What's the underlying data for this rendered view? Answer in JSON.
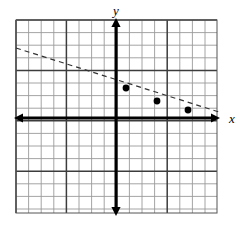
{
  "figure": {
    "kind": "cartesian-coordinate-grid",
    "title": "",
    "background_color": "#ffffff"
  },
  "grid": {
    "left_px": 16,
    "top_px": 20,
    "right_px": 217,
    "bottom_px": 213,
    "cell_px": 12.6,
    "columns": 16,
    "rows": 15,
    "minor_color": "#9a9a9a",
    "major_color": "#3c3c3c",
    "major_every": 4,
    "minor_width": 0.9,
    "major_width": 1.5,
    "border_color": "#555555"
  },
  "axes": {
    "origin_x_px": 116,
    "origin_y_px": 118,
    "color": "#000000",
    "stroke_width": 3,
    "arrow_size": 7,
    "x_axis": {
      "label": "x",
      "label_x_px": 232,
      "label_y_px": 123,
      "start_px": 14,
      "end_px": 220,
      "arrows": "both"
    },
    "y_axis": {
      "label": "y",
      "label_x_px": 116,
      "label_y_px": 15,
      "start_px": 18,
      "end_px": 216,
      "arrows": "both"
    }
  },
  "chart_data": {
    "type": "line",
    "title": "",
    "xlabel": "x",
    "ylabel": "y",
    "grid": true,
    "legend": null,
    "xlim": [
      -8,
      8
    ],
    "ylim": [
      -7.5,
      7.8
    ],
    "series": [
      {
        "name": "dashed-line",
        "style": "dashed",
        "color": "#333333",
        "dash_pattern": "5,4",
        "stroke_width": 1.2,
        "x": [
          -8,
          8
        ],
        "y": [
          5.55,
          -0.33
        ],
        "slope": -0.3675,
        "intercept": 2.61
      }
    ],
    "points": [
      {
        "label": "point-1",
        "x": 0.79,
        "y": 2.38,
        "px": 126,
        "py": 88,
        "radius_px": 3.4
      },
      {
        "label": "point-2",
        "x": 3.25,
        "y": 1.35,
        "px": 157,
        "py": 101,
        "radius_px": 3.4
      },
      {
        "label": "point-3",
        "x": 5.71,
        "y": 0.63,
        "px": 188,
        "py": 110,
        "radius_px": 3.4
      }
    ],
    "point_color": "#000000",
    "line_pixel_path": {
      "x1": 16,
      "y1": 48,
      "x2": 219,
      "y2": 112
    }
  }
}
